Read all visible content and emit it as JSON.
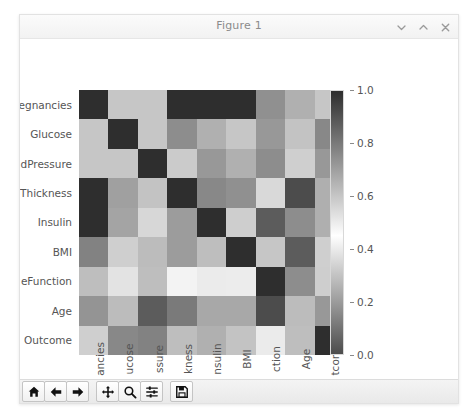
{
  "window": {
    "title": "Figure 1",
    "controls": [
      {
        "name": "minimize-button",
        "icon": "chevron-down-icon"
      },
      {
        "name": "maximize-button",
        "icon": "chevron-up-icon"
      },
      {
        "name": "close-button",
        "icon": "close-icon"
      }
    ]
  },
  "toolbar": {
    "buttons": [
      {
        "name": "home-button",
        "icon": "home-icon",
        "tooltip": "Reset original view"
      },
      {
        "name": "back-button",
        "icon": "arrow-left-icon",
        "tooltip": "Back to previous view"
      },
      {
        "name": "forward-button",
        "icon": "arrow-right-icon",
        "tooltip": "Forward to next view"
      },
      {
        "name": "pan-button",
        "icon": "move-icon",
        "tooltip": "Pan axes with left mouse, zoom with right"
      },
      {
        "name": "zoom-button",
        "icon": "magnifier-icon",
        "tooltip": "Zoom to rectangle"
      },
      {
        "name": "subplots-button",
        "icon": "sliders-icon",
        "tooltip": "Configure subplots"
      },
      {
        "name": "save-button",
        "icon": "floppy-disk-icon",
        "tooltip": "Save the figure"
      }
    ]
  },
  "chart_data": {
    "type": "heatmap",
    "title": "",
    "xlabel": "",
    "ylabel": "",
    "grid": false,
    "colormap": "gray-diverging",
    "legend_position": "right",
    "colorbar": {
      "label": "",
      "vmin": 0.0,
      "vmax": 1.0,
      "ticks": [
        0.0,
        0.2,
        0.4,
        0.6,
        0.8,
        1.0
      ],
      "tick_labels": [
        "0.0",
        "0.2",
        "0.4",
        "0.6",
        "0.8",
        "1.0"
      ]
    },
    "x_tick_labels": [
      "ancies",
      "ucose",
      "ssure",
      "kness",
      "nsulin",
      "BMI",
      "ction",
      "Age",
      "tcome"
    ],
    "y_tick_labels": [
      "egnancies",
      "Glucose",
      "dPressure",
      "Thickness",
      "Insulin",
      "BMI",
      "eFunction",
      "Age",
      "Outcome"
    ],
    "x_tick_labels_full": [
      "Pregnancies",
      "Glucose",
      "BloodPressure",
      "SkinThickness",
      "Insulin",
      "BMI",
      "DiabetesPedigreeFunction",
      "Age",
      "Outcome"
    ],
    "y_tick_labels_full": [
      "Pregnancies",
      "Glucose",
      "BloodPressure",
      "SkinThickness",
      "Insulin",
      "BMI",
      "DiabetesPedigreeFunction",
      "Age",
      "Outcome"
    ],
    "categories": [
      "Pregnancies",
      "Glucose",
      "BloodPressure",
      "SkinThickness",
      "Insulin",
      "BMI",
      "DiabetesPedigreeFunction",
      "Age",
      "Outcome"
    ],
    "values": [
      [
        1.0,
        0.6,
        0.6,
        1.0,
        1.0,
        1.0,
        0.17,
        0.25,
        0.6
      ],
      [
        0.6,
        1.0,
        0.6,
        0.75,
        0.25,
        0.6,
        0.72,
        0.3,
        0.15
      ],
      [
        0.6,
        0.6,
        1.0,
        0.32,
        0.72,
        0.25,
        0.75,
        0.33,
        0.72
      ],
      [
        1.0,
        0.7,
        0.3,
        1.0,
        0.15,
        0.17,
        0.55,
        0.92,
        0.66
      ],
      [
        1.0,
        0.22,
        0.35,
        0.2,
        1.0,
        0.58,
        0.88,
        0.75,
        0.66
      ],
      [
        0.78,
        0.33,
        0.28,
        0.2,
        0.62,
        1.0,
        0.6,
        0.88,
        0.33
      ],
      [
        0.62,
        0.38,
        0.62,
        0.42,
        0.4,
        0.5,
        1.0,
        0.75,
        0.58
      ],
      [
        0.18,
        0.28,
        0.88,
        0.8,
        0.68,
        0.68,
        0.92,
        0.28,
        0.72
      ],
      [
        0.33,
        0.15,
        0.78,
        0.62,
        0.25,
        0.3,
        0.4,
        0.62,
        1.0
      ]
    ]
  }
}
